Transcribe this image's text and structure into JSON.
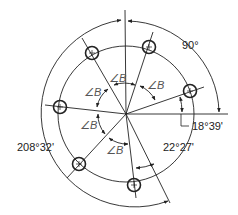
{
  "diagram": {
    "type": "bolt-circle-hole-pattern",
    "holes_count": 6,
    "labels": {
      "top_right_angle": "90°",
      "first_hole_angle": "18°39'",
      "last_hole_angle": "22°27'",
      "total_span_angle": "208°32'",
      "equal_spacing": "∠B"
    },
    "spacing_labels": [
      "∠B",
      "∠B",
      "∠B",
      "∠B",
      "∠B"
    ]
  }
}
